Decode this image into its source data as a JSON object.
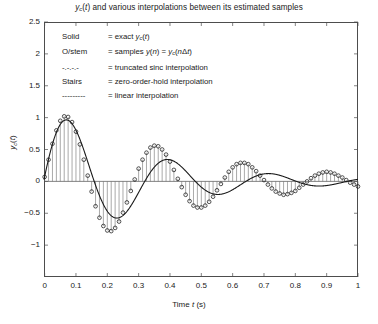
{
  "axes": {
    "xlabel": "Time t (s)",
    "ylabel": "y_c(t)",
    "xlim": [
      0,
      1
    ],
    "ylim": [
      -1.5,
      2.5
    ],
    "xticks": [
      "0",
      "0.1",
      "0.2",
      "0.3",
      "0.4",
      "0.5",
      "0.6",
      "0.7",
      "0.8",
      "0.9",
      "1"
    ],
    "xtick_values": [
      0,
      0.1,
      0.2,
      0.3,
      0.4,
      0.5,
      0.6,
      0.7,
      0.8,
      0.9,
      1
    ],
    "yticks": [
      "2.5",
      "2",
      "1.5",
      "1",
      "0.5",
      "0",
      "-0.5",
      "-1"
    ],
    "ytick_values": [
      2.5,
      2,
      1.5,
      1,
      0.5,
      0,
      -0.5,
      -1
    ],
    "grid": false,
    "box": true
  },
  "legend": {
    "rows": [
      {
        "key": "Solid",
        "desc": "= exact y_c(t)"
      },
      {
        "key": "O/stem",
        "desc": "= samples y(n) = y_c(nΔt)"
      },
      {
        "key": "-.-.-.-",
        "desc": "= truncated sinc interpolation"
      },
      {
        "key": "Stairs",
        "desc": "= zero-order-hold interpolation"
      },
      {
        "key": "---------",
        "desc": "= linear interpolation"
      }
    ]
  },
  "colors": {
    "axis": "#4d4d4d",
    "curve": "#1a1a1a",
    "stem": "#6e6e6e",
    "marker_edge": "#1a1a1a",
    "background": "#ffffff"
  },
  "chart_data": {
    "type": "line",
    "xlabel": "Time t (s)",
    "ylabel": "y_c(t)",
    "xlim": [
      -0.002,
      1.0
    ],
    "ylim": [
      -1.5,
      2.5
    ],
    "grid": false,
    "legend_position": "upper-left-textblock",
    "series": [
      {
        "name": "exact y_c(t)",
        "style": "solid",
        "model": {
          "form": "exp(-a*t)*sin(2*pi*f*t+phi)",
          "a": 3.2,
          "f": 3.1,
          "phi": 0.06,
          "amplitude": 1.22
        }
      },
      {
        "name": "samples y(n) = y_c(nΔt)",
        "style": "stem-circle",
        "sample_interval_dt": 0.0125,
        "x": [
          0,
          0.0125,
          0.025,
          0.0375,
          0.05,
          0.0625,
          0.075,
          0.0875,
          0.1,
          0.1125,
          0.125,
          0.1375,
          0.15,
          0.1625,
          0.175,
          0.1875,
          0.2,
          0.2125,
          0.225,
          0.2375,
          0.25,
          0.2625,
          0.275,
          0.2875,
          0.3,
          0.3125,
          0.325,
          0.3375,
          0.35,
          0.3625,
          0.375,
          0.3875,
          0.4,
          0.4125,
          0.425,
          0.4375,
          0.45,
          0.4625,
          0.475,
          0.4875,
          0.5,
          0.5125,
          0.525,
          0.5375,
          0.55,
          0.5625,
          0.575,
          0.5875,
          0.6,
          0.6125,
          0.625,
          0.6375,
          0.65,
          0.6625,
          0.675,
          0.6875,
          0.7,
          0.7125,
          0.725,
          0.7375,
          0.75,
          0.7625,
          0.775,
          0.7875,
          0.8,
          0.8125,
          0.825,
          0.8375,
          0.85,
          0.8625,
          0.875,
          0.8875,
          0.9,
          0.9125,
          0.925,
          0.9375,
          0.95,
          0.9625,
          0.975,
          0.9875,
          1.0
        ],
        "y": [
          0.07,
          0.34,
          0.59,
          0.8,
          0.95,
          1.02,
          1.01,
          0.93,
          0.78,
          0.58,
          0.34,
          0.09,
          -0.16,
          -0.39,
          -0.57,
          -0.7,
          -0.77,
          -0.78,
          -0.73,
          -0.63,
          -0.49,
          -0.33,
          -0.15,
          0.03,
          0.2,
          0.34,
          0.45,
          0.53,
          0.56,
          0.55,
          0.5,
          0.42,
          0.31,
          0.18,
          0.04,
          -0.09,
          -0.21,
          -0.31,
          -0.38,
          -0.41,
          -0.41,
          -0.38,
          -0.32,
          -0.24,
          -0.14,
          -0.04,
          0.06,
          0.15,
          0.22,
          0.27,
          0.29,
          0.29,
          0.27,
          0.22,
          0.16,
          0.09,
          0.02,
          -0.05,
          -0.11,
          -0.16,
          -0.19,
          -0.21,
          -0.2,
          -0.18,
          -0.15,
          -0.1,
          -0.05,
          0.0,
          0.05,
          0.09,
          0.12,
          0.14,
          0.15,
          0.14,
          0.12,
          0.09,
          0.06,
          0.02,
          -0.02,
          -0.05,
          -0.08
        ]
      },
      {
        "name": "truncated sinc interpolation",
        "style": "dash-dot"
      },
      {
        "name": "zero-order-hold interpolation",
        "style": "stairs"
      },
      {
        "name": "linear interpolation",
        "style": "dashed"
      }
    ]
  }
}
